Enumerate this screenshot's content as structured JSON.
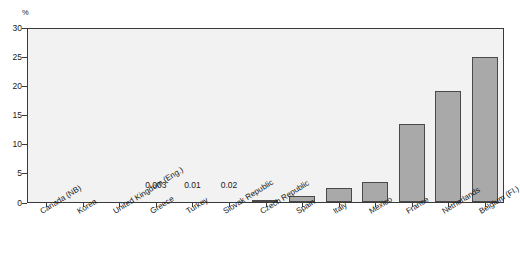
{
  "chart_data": {
    "type": "bar",
    "title": "",
    "subtitle": "",
    "xlabel": "",
    "ylabel": "%",
    "ylim": [
      0,
      30
    ],
    "yticks": [
      0,
      5,
      10,
      15,
      20,
      25,
      30
    ],
    "grid": false,
    "legend": null,
    "bar_color": "#a9a9a9",
    "bar_edge_color": "#4a4a4a",
    "plot_background": "#f2f2f2",
    "categories": [
      "Canada (NB)",
      "Korea",
      "United Kingdom (Eng.)",
      "Greece",
      "Turkey",
      "Slovak Republic",
      "Czech Republic",
      "Spain",
      "Italy",
      "Mexico",
      "France",
      "Netherlands",
      "Belgium (Fl.)"
    ],
    "values": [
      0,
      0,
      0,
      0.003,
      0.01,
      0.02,
      0.4,
      1.1,
      2.5,
      3.5,
      13.5,
      19.3,
      25.2
    ],
    "point_labels": [
      "",
      "",
      "",
      "0.003",
      "0.01",
      "0.02",
      "",
      "",
      "",
      "",
      "",
      "",
      ""
    ],
    "annotations": []
  },
  "axis": {
    "y_unit": "%",
    "y_tick_labels": [
      "30",
      "25",
      "20",
      "15",
      "10",
      "5",
      "0"
    ]
  }
}
